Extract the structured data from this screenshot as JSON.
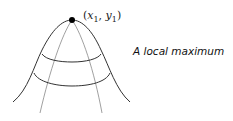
{
  "diagram": {
    "point": {
      "name": "x",
      "sub1": "1",
      "sep": ", ",
      "name2": "y",
      "sub2": "1",
      "open": "(",
      "close": ")"
    },
    "caption": "A local maximum",
    "colors": {
      "stroke": "#333333",
      "light_stroke": "#888888",
      "point": "#000000"
    }
  }
}
